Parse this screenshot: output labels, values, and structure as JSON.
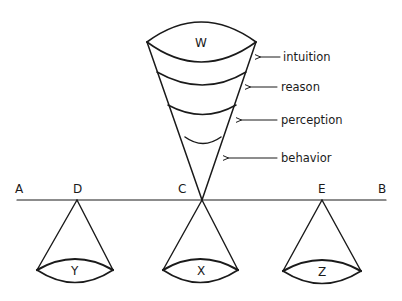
{
  "diagram": {
    "baseline": {
      "endpoints": {
        "left": "A",
        "right": "B"
      },
      "points": [
        "D",
        "C",
        "E"
      ]
    },
    "upper_cone": {
      "top_label": "W",
      "levels": [
        {
          "label": "intuition"
        },
        {
          "label": "reason"
        },
        {
          "label": "perception"
        },
        {
          "label": "behavior"
        }
      ]
    },
    "lower_cones": [
      {
        "apex": "D",
        "base_label": "Y"
      },
      {
        "apex": "C",
        "base_label": "X"
      },
      {
        "apex": "E",
        "base_label": "Z"
      }
    ],
    "colors": {
      "ink": "#1a1a1a",
      "background": "#ffffff"
    }
  }
}
